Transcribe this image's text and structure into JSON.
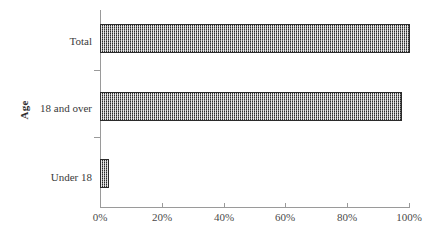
{
  "chart_data": {
    "type": "bar",
    "orientation": "horizontal",
    "title": "",
    "xlabel": "",
    "ylabel": "Age",
    "categories": [
      "Total",
      "18 and over",
      "Under 18"
    ],
    "values": [
      100,
      97.5,
      2.5
    ],
    "value_format": "percent",
    "xlim": [
      0,
      100
    ],
    "xticks": [
      0,
      20,
      40,
      60,
      80,
      100
    ],
    "xtick_labels": [
      "0%",
      "20%",
      "40%",
      "60%",
      "80%",
      "100%"
    ],
    "grid": false,
    "legend": null,
    "series": [
      {
        "name": "Age distribution",
        "values": [
          100,
          97.5,
          2.5
        ],
        "fill_color": "#7d7d7d",
        "edge_color": "#2b2b2b",
        "fill_pattern": "fine-checkerboard"
      }
    ]
  },
  "axes": {
    "y_title": "Age",
    "y_categories": [
      {
        "label": "Total"
      },
      {
        "label": "18 and over"
      },
      {
        "label": "Under 18"
      }
    ],
    "x_tick_labels": [
      "0%",
      "20%",
      "40%",
      "60%",
      "80%",
      "100%"
    ]
  },
  "colors": {
    "background": "#ffffff",
    "axis_line": "#9a9a9a",
    "text": "#3a3a3a",
    "bar_fill": "#7d7d7d",
    "bar_edge": "#2b2b2b"
  }
}
